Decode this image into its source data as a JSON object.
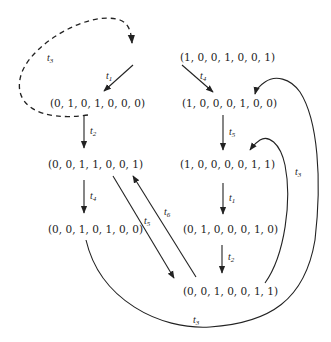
{
  "diagram": {
    "type": "reachability-graph",
    "nodes": [
      {
        "id": "n0",
        "label": "(1, 0, 0, 1, 0, 0, 1)"
      },
      {
        "id": "n1",
        "label": "(0, 1, 0, 1, 0, 0, 0)"
      },
      {
        "id": "n2",
        "label": "(1, 0, 0, 0, 1, 0, 0)"
      },
      {
        "id": "n3",
        "label": "(0, 0, 1, 1, 0, 0, 1)"
      },
      {
        "id": "n4",
        "label": "(1, 0, 0, 0, 0, 1, 1)"
      },
      {
        "id": "n5",
        "label": "(0, 0, 1, 0, 1, 0, 0)"
      },
      {
        "id": "n6",
        "label": "(0, 1, 0, 0, 0, 1, 0)"
      },
      {
        "id": "n7",
        "label": "(0, 0, 1, 0, 0, 1, 1)"
      }
    ],
    "edges": [
      {
        "from": "n1",
        "to": "n0",
        "label": "t3",
        "style": "dashed"
      },
      {
        "from": "n0",
        "to": "n1",
        "label": "t1",
        "style": "solid"
      },
      {
        "from": "n0",
        "to": "n2",
        "label": "t4",
        "style": "solid"
      },
      {
        "from": "n1",
        "to": "n3",
        "label": "t2",
        "style": "solid"
      },
      {
        "from": "n2",
        "to": "n4",
        "label": "t5",
        "style": "solid"
      },
      {
        "from": "n3",
        "to": "n5",
        "label": "t4",
        "style": "solid"
      },
      {
        "from": "n3",
        "to": "n7",
        "label": "t5",
        "style": "solid"
      },
      {
        "from": "n7",
        "to": "n3",
        "label": "t6",
        "style": "solid"
      },
      {
        "from": "n4",
        "to": "n6",
        "label": "t1",
        "style": "solid"
      },
      {
        "from": "n6",
        "to": "n7",
        "label": "t2",
        "style": "solid"
      },
      {
        "from": "n7",
        "to": "n4",
        "label": "t3",
        "style": "solid"
      },
      {
        "from": "n5",
        "to": "n2",
        "label": "t3",
        "style": "solid"
      }
    ],
    "labels": {
      "t1": "t",
      "t1_sub": "1",
      "t2": "t",
      "t2_sub": "2",
      "t3": "t",
      "t3_sub": "3",
      "t4": "t",
      "t4_sub": "4",
      "t5": "t",
      "t5_sub": "5",
      "t6": "t",
      "t6_sub": "6"
    }
  }
}
